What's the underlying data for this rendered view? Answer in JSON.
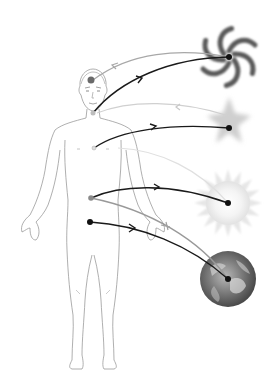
{
  "diagram": {
    "title": "Human body energy connections to cosmos",
    "colors": {
      "background": "#ffffff",
      "body_outline": "#9a9a9a",
      "outgoing_arrow": "#1a1a1a",
      "incoming_arrow": "#a8a8a8",
      "galaxy": "#5a5a5a",
      "star": "#cfcfcf",
      "sun": "#ececec",
      "earth": "#6e6e6e"
    },
    "nodes": [
      {
        "id": "head",
        "label": "Head point"
      },
      {
        "id": "throat",
        "label": "Throat point"
      },
      {
        "id": "chest",
        "label": "Chest point"
      },
      {
        "id": "navel",
        "label": "Navel point"
      },
      {
        "id": "pelvis",
        "label": "Pelvis point"
      }
    ],
    "bodies": [
      {
        "id": "galaxy",
        "label": "Spiral galaxy"
      },
      {
        "id": "star",
        "label": "Star"
      },
      {
        "id": "sun",
        "label": "Sun"
      },
      {
        "id": "earth",
        "label": "Earth"
      }
    ],
    "connections": [
      {
        "from": "galaxy",
        "to": "head",
        "style": "incoming"
      },
      {
        "from": "throat",
        "to": "galaxy",
        "style": "outgoing"
      },
      {
        "from": "star",
        "to": "throat",
        "style": "incoming"
      },
      {
        "from": "chest",
        "to": "star",
        "style": "outgoing"
      },
      {
        "from": "sun",
        "to": "chest",
        "style": "incoming"
      },
      {
        "from": "navel",
        "to": "sun",
        "style": "outgoing"
      },
      {
        "from": "earth",
        "to": "navel",
        "style": "incoming"
      },
      {
        "from": "pelvis",
        "to": "earth",
        "style": "outgoing"
      }
    ]
  }
}
